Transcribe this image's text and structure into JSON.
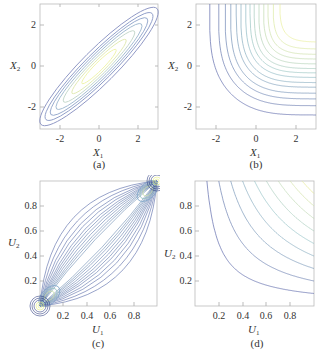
{
  "figure": {
    "panels": [
      {
        "id": "a",
        "caption": "(a)",
        "xlabel": "X",
        "xlabel_sub": "1",
        "ylabel": "X",
        "ylabel_sub": "2",
        "xticks": [
          "-2",
          "0",
          "2"
        ],
        "yticks": [
          "-2",
          "0",
          "2"
        ]
      },
      {
        "id": "b",
        "caption": "(b)",
        "xlabel": "X",
        "xlabel_sub": "1",
        "ylabel": "X",
        "ylabel_sub": "2",
        "xticks": [
          "-2",
          "0",
          "2"
        ],
        "yticks": [
          "-2",
          "0",
          "2"
        ]
      },
      {
        "id": "c",
        "caption": "(c)",
        "xlabel": "U",
        "xlabel_sub": "1",
        "ylabel": "U",
        "ylabel_sub": "2",
        "xticks": [
          "0.2",
          "0.4",
          "0.6",
          "0.8"
        ],
        "yticks": [
          "0.2",
          "0.4",
          "0.6",
          "0.8"
        ]
      },
      {
        "id": "d",
        "caption": "(d)",
        "xlabel": "U",
        "xlabel_sub": "1",
        "ylabel": "U",
        "ylabel_sub": "2",
        "xticks": [
          "0.2",
          "0.4",
          "0.6",
          "0.8"
        ],
        "yticks": [
          "0.2",
          "0.4",
          "0.6",
          "0.8"
        ]
      }
    ],
    "footer_text": ""
  },
  "chart_data": [
    {
      "type": "contour",
      "panel": "(a)",
      "title": "",
      "xlabel": "X1",
      "ylabel": "X2",
      "xlim": [
        -3,
        3
      ],
      "ylim": [
        -3,
        3
      ],
      "xticks": [
        -2,
        0,
        2
      ],
      "yticks": [
        -2,
        0,
        2
      ],
      "description": "Bivariate normal density with strong positive correlation; elongated ellipses along diagonal, yellow-green center, blue outer contours"
    },
    {
      "type": "contour",
      "panel": "(b)",
      "title": "",
      "xlabel": "X1",
      "ylabel": "X2",
      "xlim": [
        -3,
        3
      ],
      "ylim": [
        -3,
        3
      ],
      "xticks": [
        -2,
        0,
        2
      ],
      "yticks": [
        -2,
        0,
        2
      ],
      "description": "Joint CDF contours of independent normals; L-shaped curves increasing toward upper-right, yellow at top right"
    },
    {
      "type": "contour",
      "panel": "(c)",
      "title": "",
      "xlabel": "U1",
      "ylabel": "U2",
      "xlim": [
        0,
        1
      ],
      "ylim": [
        0,
        1
      ],
      "xticks": [
        0.2,
        0.4,
        0.6,
        0.8
      ],
      "yticks": [
        0.2,
        0.4,
        0.6,
        0.8
      ],
      "description": "Gaussian copula density with positive dependence; contours concentrated at (0,0) and (1,1) corners"
    },
    {
      "type": "contour",
      "panel": "(d)",
      "title": "",
      "xlabel": "U1",
      "ylabel": "U2",
      "xlim": [
        0,
        1
      ],
      "ylim": [
        0,
        1
      ],
      "xticks": [
        0.2,
        0.4,
        0.6,
        0.8
      ],
      "yticks": [
        0.2,
        0.4,
        0.6,
        0.8
      ],
      "description": "Independence copula CDF (u1*u2) contours; hyperbola-like L shapes, yellow near (1,1)"
    }
  ]
}
